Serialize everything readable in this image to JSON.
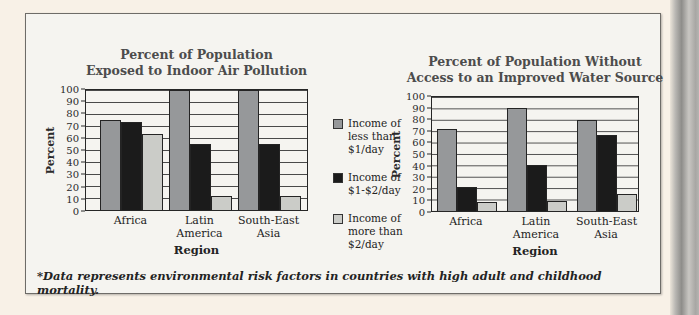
{
  "figure": {
    "footnote": "*Data represents environmental risk factors in countries with high adult and childhood mortality."
  },
  "legend": {
    "position": "center-between-charts",
    "items": [
      {
        "label": "Income of less than $1/day",
        "lines": [
          "Income of",
          "less than",
          "$1/day"
        ],
        "color": "#96989a"
      },
      {
        "label": "Income of $1-$2/day",
        "lines": [
          "Income of",
          "$1-$2/day"
        ],
        "color": "#1b1b1b"
      },
      {
        "label": "Income of more than $2/day",
        "lines": [
          "Income of",
          "more than",
          "$2/day"
        ],
        "color": "#cbccc8"
      }
    ]
  },
  "chart_data": [
    {
      "type": "bar",
      "title": "Percent of Population Exposed to Indoor Air Pollution",
      "title_lines": [
        "Percent of Population",
        "Exposed to Indoor Air Pollution"
      ],
      "xlabel": "Region",
      "ylabel": "Percent",
      "ylim": [
        0,
        100
      ],
      "ytick_step": 10,
      "grid": true,
      "categories": [
        "Africa",
        "Latin America",
        "South-East Asia"
      ],
      "category_lines": [
        [
          "Africa"
        ],
        [
          "Latin",
          "America"
        ],
        [
          "South-East",
          "Asia"
        ]
      ],
      "series": [
        {
          "name": "Income of less than $1/day",
          "color": "#96989a",
          "values": [
            75,
            100,
            100
          ]
        },
        {
          "name": "Income of $1-$2/day",
          "color": "#1b1b1b",
          "values": [
            73,
            55,
            55
          ]
        },
        {
          "name": "Income of more than $2/day",
          "color": "#cbccc8",
          "values": [
            63,
            12,
            12
          ]
        }
      ]
    },
    {
      "type": "bar",
      "title": "Percent of Population Without Access to an Improved Water Source",
      "title_lines": [
        "Percent of Population Without",
        "Access to an Improved Water Source"
      ],
      "xlabel": "Region",
      "ylabel": "Percent",
      "ylim": [
        0,
        100
      ],
      "ytick_step": 10,
      "grid": true,
      "categories": [
        "Africa",
        "Latin America",
        "South-East Asia"
      ],
      "category_lines": [
        [
          "Africa"
        ],
        [
          "Latin",
          "America"
        ],
        [
          "South-East",
          "Asia"
        ]
      ],
      "series": [
        {
          "name": "Income of less than $1/day",
          "color": "#96989a",
          "values": [
            72,
            90,
            80
          ]
        },
        {
          "name": "Income of $1-$2/day",
          "color": "#1b1b1b",
          "values": [
            21,
            40,
            67
          ]
        },
        {
          "name": "Income of more than $2/day",
          "color": "#cbccc8",
          "values": [
            8,
            9,
            15
          ]
        }
      ]
    }
  ]
}
